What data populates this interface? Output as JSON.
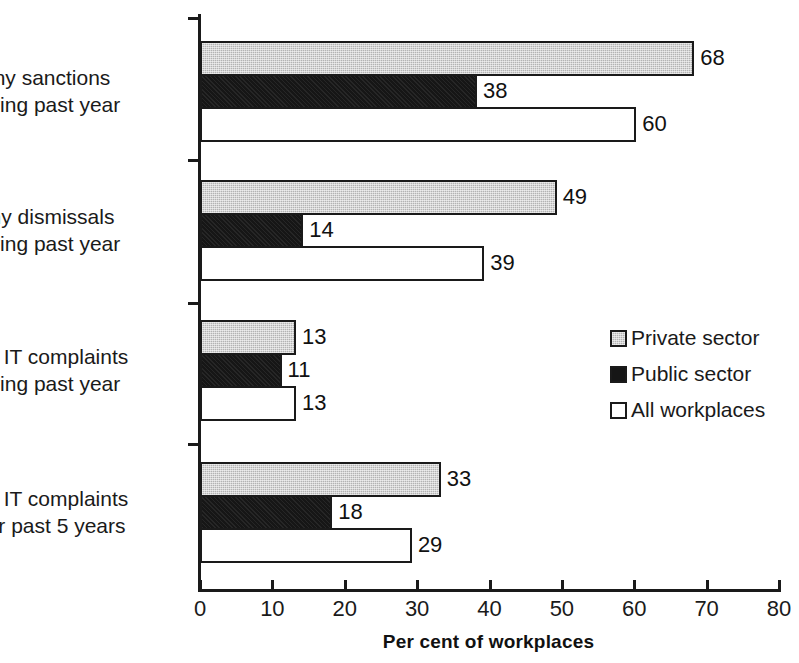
{
  "chart_data": {
    "type": "bar",
    "orientation": "horizontal",
    "title": "",
    "xlabel": "Per cent of workplaces",
    "ylabel": "",
    "xlim": [
      0,
      80
    ],
    "xticks": [
      0,
      10,
      20,
      30,
      40,
      50,
      60,
      70,
      80
    ],
    "xtick_labels": [
      "0",
      "10",
      "20",
      "30",
      "40",
      "50",
      "60",
      "70",
      "80"
    ],
    "grid": false,
    "legend_position": "center-right",
    "categories": [
      "Any sanctions during past year",
      "Any dismissals during past year",
      "Any IT complaints during past year",
      "Any IT complaints over past 5 years"
    ],
    "category_lines": [
      [
        "Any sanctions",
        "during past year"
      ],
      [
        "Any dismissals",
        "during past year"
      ],
      [
        "Any IT complaints",
        "during past year"
      ],
      [
        "Any IT complaints",
        "over past 5 years"
      ]
    ],
    "series": [
      {
        "name": "Private sector",
        "color": "#b3b3b3",
        "values": [
          68,
          49,
          13,
          33
        ]
      },
      {
        "name": "Public sector",
        "color": "#161616",
        "values": [
          38,
          14,
          11,
          18
        ]
      },
      {
        "name": "All workplaces",
        "color": "#ffffff",
        "values": [
          60,
          39,
          13,
          29
        ]
      }
    ]
  },
  "legend": {
    "items": [
      {
        "label": "Private sector",
        "swatch": "private"
      },
      {
        "label": "Public sector",
        "swatch": "public"
      },
      {
        "label": "All workplaces",
        "swatch": "all"
      }
    ]
  },
  "axis": {
    "x_title": "Per cent of workplaces"
  }
}
